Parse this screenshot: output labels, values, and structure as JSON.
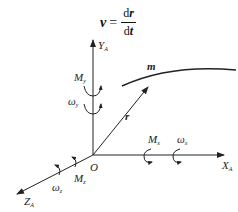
{
  "formula": {
    "lhs": "v",
    "eq": "=",
    "numerator_d": "d",
    "numerator_var": "r",
    "denominator_d": "d",
    "denominator_var": "t"
  },
  "axes": {
    "y": {
      "label": "Y",
      "sub": "A"
    },
    "x": {
      "label": "X",
      "sub": "A"
    },
    "z": {
      "label": "Z",
      "sub": "A"
    },
    "origin": "O"
  },
  "vector_label": "r",
  "curve_label": "m",
  "moments": {
    "my": {
      "label": "M",
      "sub": "y"
    },
    "wy": {
      "label": "ω",
      "sub": "y"
    },
    "mx": {
      "label": "M",
      "sub": "x"
    },
    "wx": {
      "label": "ω",
      "sub": "x"
    },
    "mz": {
      "label": "M",
      "sub": "z"
    },
    "wz": {
      "label": "ω",
      "sub": "z"
    }
  },
  "colors": {
    "line": "#222222"
  }
}
